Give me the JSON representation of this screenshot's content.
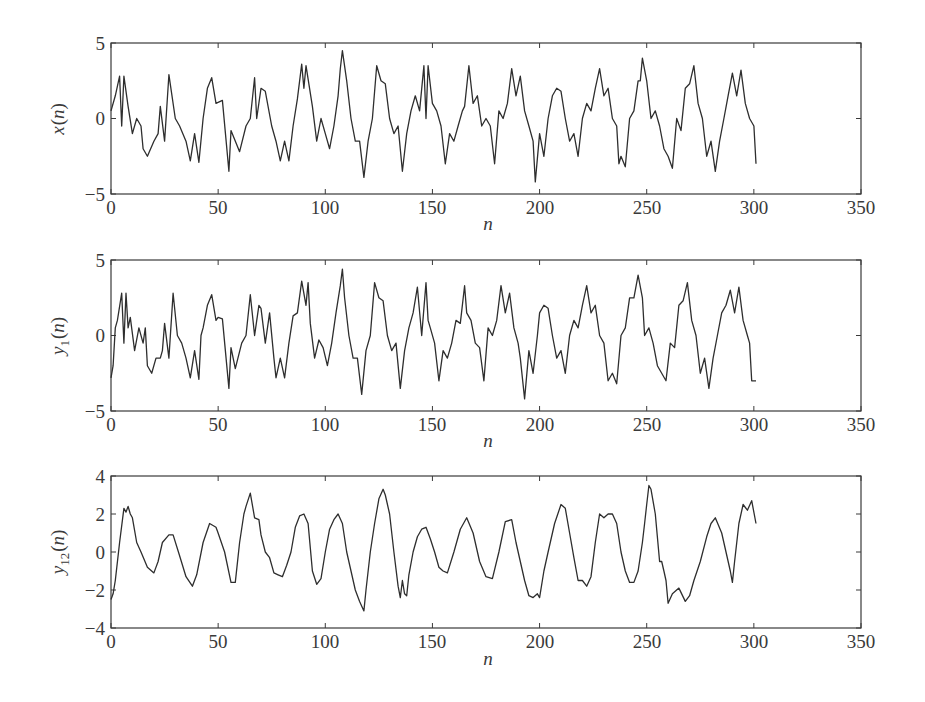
{
  "chart_data": [
    {
      "type": "line",
      "title": "",
      "xlabel": "n",
      "ylabel": "x(n)",
      "xlim": [
        0,
        350
      ],
      "ylim": [
        -5,
        5
      ],
      "xticks": [
        0,
        50,
        100,
        150,
        200,
        250,
        300,
        350
      ],
      "yticks": [
        -5,
        0,
        5
      ],
      "grid": false,
      "series": [
        {
          "name": "x(n)",
          "x": [
            0,
            2,
            4,
            5,
            6,
            8,
            10,
            12,
            14,
            15,
            17,
            20,
            22,
            23,
            25,
            27,
            30,
            32,
            35,
            37,
            39,
            41,
            43,
            45,
            47,
            49,
            52,
            55,
            56,
            60,
            63,
            65,
            67,
            68,
            70,
            72,
            75,
            77,
            79,
            81,
            83,
            85,
            87,
            89,
            90,
            91,
            94,
            96,
            98,
            100,
            102,
            104,
            106,
            107,
            108,
            110,
            112,
            114,
            116,
            118,
            120,
            122,
            124,
            126,
            128,
            130,
            132,
            134,
            136,
            138,
            140,
            142,
            144,
            146,
            147,
            148,
            150,
            152,
            154,
            156,
            158,
            160,
            162,
            164,
            165,
            167,
            169,
            171,
            173,
            175,
            177,
            179,
            181,
            183,
            185,
            187,
            189,
            191,
            193,
            195,
            197,
            198,
            200,
            202,
            204,
            206,
            208,
            210,
            212,
            214,
            216,
            218,
            220,
            222,
            224,
            226,
            228,
            230,
            232,
            234,
            236,
            237,
            238,
            240,
            242,
            244,
            246,
            247,
            248,
            250,
            252,
            254,
            256,
            258,
            260,
            262,
            264,
            266,
            268,
            270,
            272,
            274,
            276,
            278,
            280,
            282,
            284,
            286,
            288,
            290,
            292,
            294,
            296,
            298,
            300,
            301
          ],
          "values": [
            0.5,
            1.5,
            2.8,
            -0.5,
            2.8,
            0.8,
            -1.0,
            0.0,
            -0.5,
            -2.0,
            -2.5,
            -1.5,
            -1.0,
            0.8,
            -1.5,
            2.9,
            0.0,
            -0.5,
            -1.5,
            -2.8,
            -1.0,
            -2.9,
            0.0,
            2.0,
            2.7,
            1.0,
            1.2,
            -3.5,
            -0.8,
            -2.2,
            -0.5,
            0.0,
            2.7,
            0.0,
            2.0,
            1.8,
            -0.5,
            -1.5,
            -2.8,
            -1.5,
            -2.8,
            -0.5,
            1.3,
            3.6,
            2.0,
            3.5,
            0.8,
            -1.5,
            0.0,
            -1.0,
            -2.0,
            -0.5,
            1.5,
            3.3,
            4.5,
            2.5,
            0.0,
            -1.5,
            -1.5,
            -3.9,
            -1.5,
            0.0,
            3.5,
            2.5,
            2.3,
            0.0,
            -1.0,
            -0.5,
            -3.5,
            -1.0,
            0.5,
            1.5,
            0.5,
            3.5,
            0.0,
            3.5,
            1.0,
            0.5,
            -0.5,
            -3.0,
            -1.0,
            -1.5,
            -0.5,
            0.5,
            0.8,
            3.5,
            1.0,
            1.5,
            -0.5,
            0.0,
            -0.5,
            -3.0,
            0.5,
            0.0,
            1.0,
            3.3,
            1.5,
            2.8,
            0.5,
            -0.5,
            -1.5,
            -4.2,
            -1.0,
            -2.5,
            0.0,
            1.5,
            2.0,
            1.8,
            0.0,
            -1.5,
            -1.0,
            -2.5,
            0.0,
            1.0,
            0.5,
            2.0,
            3.3,
            1.5,
            2.0,
            0.0,
            -0.5,
            -3.0,
            -2.5,
            -3.2,
            0.0,
            0.5,
            2.5,
            2.5,
            4.0,
            2.5,
            0.0,
            0.5,
            -0.5,
            -2.0,
            -2.5,
            -3.3,
            0.0,
            -0.8,
            2.0,
            2.3,
            3.5,
            1.0,
            0.0,
            -2.5,
            -1.5,
            -3.5,
            -1.5,
            0.0,
            1.5,
            3.0,
            1.5,
            3.2,
            1.0,
            0.0,
            -0.5,
            -3.0,
            -0.5,
            0.0,
            0.5,
            -1.0
          ]
        }
      ]
    },
    {
      "type": "line",
      "title": "",
      "xlabel": "n",
      "ylabel": "y1(n)",
      "xlim": [
        0,
        350
      ],
      "ylim": [
        -5,
        5
      ],
      "xticks": [
        0,
        50,
        100,
        150,
        200,
        250,
        300,
        350
      ],
      "yticks": [
        -5,
        0,
        5
      ],
      "grid": false,
      "series": [
        {
          "name": "y1(n)",
          "x": [
            0,
            1,
            2,
            3,
            5,
            6,
            7,
            8,
            9,
            11,
            13,
            15,
            16,
            17,
            19,
            21,
            23,
            24,
            25,
            27,
            29,
            31,
            33,
            35,
            37,
            39,
            41,
            42,
            43,
            45,
            47,
            49,
            50,
            52,
            55,
            56,
            58,
            61,
            63,
            65,
            67,
            69,
            70,
            72,
            74,
            76,
            77,
            79,
            81,
            83,
            85,
            87,
            89,
            91,
            92,
            93,
            95,
            97,
            99,
            101,
            103,
            105,
            107,
            108,
            109,
            111,
            113,
            115,
            117,
            119,
            121,
            123,
            125,
            127,
            129,
            131,
            133,
            135,
            137,
            139,
            141,
            143,
            145,
            147,
            148,
            149,
            151,
            153,
            155,
            157,
            159,
            161,
            163,
            165,
            166,
            168,
            170,
            172,
            174,
            176,
            178,
            180,
            182,
            184,
            186,
            188,
            190,
            191,
            193,
            195,
            197,
            199,
            200,
            202,
            204,
            206,
            208,
            210,
            212,
            214,
            216,
            218,
            220,
            222,
            224,
            226,
            228,
            230,
            232,
            234,
            236,
            238,
            240,
            242,
            244,
            246,
            248,
            249,
            251,
            253,
            255,
            257,
            259,
            261,
            263,
            265,
            267,
            269,
            271,
            273,
            275,
            277,
            279,
            281,
            283,
            285,
            287,
            289,
            291,
            293,
            295,
            297,
            298,
            299,
            301
          ],
          "values": [
            -2.8,
            -2.0,
            0.5,
            1.0,
            2.8,
            -0.5,
            2.8,
            0.5,
            1.2,
            -1.0,
            0.5,
            -0.5,
            0.5,
            -2.0,
            -2.5,
            -1.5,
            -1.5,
            -1.0,
            0.8,
            -1.5,
            2.8,
            0.0,
            -0.5,
            -1.5,
            -2.8,
            -1.0,
            -2.9,
            0.0,
            0.5,
            2.0,
            2.7,
            1.0,
            1.2,
            1.1,
            -3.5,
            -0.8,
            -2.2,
            -0.5,
            0.0,
            2.7,
            0.0,
            2.0,
            1.8,
            -0.5,
            1.5,
            -1.5,
            -2.8,
            -1.5,
            -2.8,
            -0.5,
            1.3,
            1.5,
            3.6,
            2.0,
            3.5,
            0.8,
            -1.5,
            -0.3,
            -0.8,
            -2.0,
            -0.5,
            1.5,
            3.3,
            4.4,
            2.5,
            0.0,
            -1.5,
            -1.5,
            -3.9,
            -1.0,
            0.0,
            3.5,
            2.5,
            2.3,
            0.0,
            -1.0,
            -0.5,
            -3.5,
            -1.0,
            0.5,
            1.5,
            3.2,
            0.0,
            3.5,
            1.0,
            0.5,
            -0.5,
            -3.0,
            -1.0,
            -1.5,
            -0.5,
            1.0,
            0.8,
            3.3,
            1.5,
            1.0,
            -0.5,
            -0.8,
            -3.0,
            0.5,
            0.0,
            1.0,
            3.3,
            1.5,
            2.8,
            0.5,
            -0.5,
            -1.5,
            -4.2,
            -1.0,
            -2.5,
            0.0,
            1.5,
            2.0,
            1.8,
            0.0,
            -1.5,
            -1.0,
            -2.5,
            0.0,
            1.0,
            0.5,
            2.0,
            3.3,
            1.5,
            2.0,
            0.0,
            -0.5,
            -3.0,
            -2.5,
            -3.2,
            0.0,
            0.5,
            2.5,
            2.5,
            4.0,
            2.5,
            0.0,
            0.5,
            -0.5,
            -2.0,
            -2.5,
            -3.0,
            -0.5,
            -0.8,
            2.0,
            2.3,
            3.5,
            1.0,
            0.0,
            -2.5,
            -1.5,
            -3.5,
            -1.5,
            0.0,
            1.5,
            2.0,
            3.0,
            1.5,
            3.2,
            1.0,
            0.0,
            -0.5,
            -3.0,
            -3.0,
            -0.8,
            -0.5
          ]
        }
      ]
    },
    {
      "type": "line",
      "title": "",
      "xlabel": "n",
      "ylabel": "y12(n)",
      "xlim": [
        0,
        350
      ],
      "ylim": [
        -4,
        4
      ],
      "xticks": [
        0,
        50,
        100,
        150,
        200,
        250,
        300,
        350
      ],
      "yticks": [
        -4,
        -2,
        0,
        2,
        4
      ],
      "grid": false,
      "series": [
        {
          "name": "y12(n)",
          "x": [
            0,
            1,
            2,
            4,
            6,
            7,
            8,
            9,
            10,
            12,
            14,
            17,
            20,
            22,
            24,
            27,
            29,
            32,
            35,
            38,
            40,
            43,
            46,
            49,
            50,
            53,
            56,
            58,
            60,
            62,
            63,
            65,
            67,
            69,
            70,
            72,
            74,
            76,
            78,
            80,
            82,
            84,
            86,
            88,
            90,
            92,
            94,
            96,
            98,
            100,
            102,
            104,
            106,
            108,
            110,
            112,
            114,
            116,
            118,
            119,
            121,
            123,
            125,
            127,
            128,
            130,
            132,
            134,
            135,
            136,
            137,
            138,
            139,
            141,
            143,
            145,
            147,
            149,
            151,
            153,
            155,
            157,
            160,
            163,
            166,
            169,
            172,
            175,
            178,
            181,
            184,
            187,
            189,
            191,
            193,
            195,
            197,
            199,
            200,
            202,
            204,
            207,
            210,
            212,
            214,
            216,
            218,
            220,
            222,
            224,
            226,
            228,
            230,
            232,
            234,
            236,
            238,
            240,
            242,
            244,
            246,
            248,
            249,
            250,
            251,
            252,
            254,
            256,
            257,
            258,
            259,
            260,
            262,
            265,
            268,
            270,
            272,
            275,
            278,
            280,
            282,
            285,
            287,
            289,
            290,
            291,
            293,
            295,
            297,
            299,
            301
          ],
          "values": [
            -2.5,
            -2.2,
            -1.5,
            0.5,
            2.3,
            2.1,
            2.4,
            2.0,
            1.8,
            0.5,
            0.0,
            -0.8,
            -1.1,
            -0.5,
            0.5,
            0.9,
            0.9,
            -0.2,
            -1.3,
            -1.8,
            -1.2,
            0.5,
            1.5,
            1.3,
            1.0,
            0.0,
            -1.6,
            -1.6,
            0.5,
            2.0,
            2.4,
            3.1,
            1.8,
            1.7,
            0.9,
            0.0,
            -0.3,
            -1.1,
            -1.2,
            -1.3,
            -0.7,
            0.0,
            1.3,
            1.9,
            2.0,
            1.5,
            -1.0,
            -1.7,
            -1.4,
            0.0,
            1.2,
            1.7,
            2.0,
            1.5,
            0.0,
            -1.0,
            -2.0,
            -2.6,
            -3.1,
            -2.0,
            0.0,
            1.5,
            2.8,
            3.3,
            3.0,
            2.0,
            0.0,
            -1.8,
            -2.4,
            -1.5,
            -2.2,
            -2.3,
            -1.2,
            0.0,
            0.8,
            1.2,
            1.3,
            0.7,
            0.0,
            -0.8,
            -1.0,
            -1.1,
            0.0,
            1.2,
            1.8,
            1.0,
            -0.5,
            -1.3,
            -1.4,
            0.0,
            1.6,
            1.7,
            0.5,
            -0.5,
            -1.5,
            -2.3,
            -2.4,
            -2.2,
            -2.4,
            -1.0,
            0.0,
            1.5,
            2.5,
            2.3,
            1.0,
            -0.3,
            -1.5,
            -1.5,
            -1.8,
            -1.3,
            0.5,
            2.0,
            1.8,
            2.0,
            2.0,
            1.5,
            0.0,
            -1.0,
            -1.6,
            -1.6,
            -1.0,
            0.5,
            1.5,
            2.5,
            3.5,
            3.3,
            2.0,
            -0.5,
            -0.5,
            -1.0,
            -1.5,
            -2.7,
            -2.2,
            -1.9,
            -2.6,
            -2.3,
            -1.5,
            -0.5,
            0.8,
            1.5,
            1.8,
            1.0,
            0.0,
            -1.0,
            -1.6,
            -0.5,
            1.5,
            2.5,
            2.2,
            2.7,
            1.5,
            0.0,
            -2.4,
            -2.3,
            -0.8
          ]
        }
      ]
    }
  ],
  "plots": [
    {
      "ylabel_main": "x",
      "ylabel_sub": "",
      "ylabel_arg": "(n)",
      "xlabel": "n",
      "xtick_labels": [
        "0",
        "50",
        "100",
        "150",
        "200",
        "250",
        "300",
        "350"
      ],
      "ytick_labels": [
        "5",
        "0",
        "−5"
      ]
    },
    {
      "ylabel_main": "y",
      "ylabel_sub": "1",
      "ylabel_arg": "(n)",
      "xlabel": "n",
      "xtick_labels": [
        "0",
        "50",
        "100",
        "150",
        "200",
        "250",
        "300",
        "350"
      ],
      "ytick_labels": [
        "5",
        "0",
        "−5"
      ]
    },
    {
      "ylabel_main": "y",
      "ylabel_sub": "12",
      "ylabel_arg": "(n)",
      "xlabel": "n",
      "xtick_labels": [
        "0",
        "50",
        "100",
        "150",
        "200",
        "250",
        "300",
        "350"
      ],
      "ytick_labels": [
        "4",
        "2",
        "0",
        "−2",
        "−4"
      ]
    }
  ],
  "colors": {
    "line": "#2e2e2e",
    "axes": "#3a3a3a",
    "background": "#ffffff"
  }
}
